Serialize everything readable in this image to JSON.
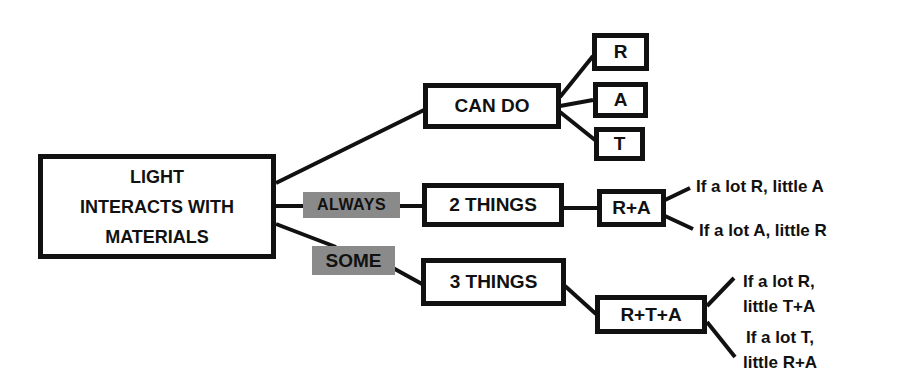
{
  "diagram": {
    "root": {
      "lines": [
        "LIGHT",
        "INTERACTS WITH",
        "MATERIALS"
      ]
    },
    "edge_labels": {
      "always": "ALWAYS",
      "some": "SOME"
    },
    "nodes": {
      "can_do": "CAN DO",
      "r": "R",
      "a": "A",
      "t": "T",
      "two_things": "2 THINGS",
      "r_plus_a": "R+A",
      "three_things": "3 THINGS",
      "r_plus_t_plus_a": "R+T+A"
    },
    "notes": {
      "lot_r_little_a": "If a lot R, little A",
      "lot_a_little_r": "If a lot A, little R",
      "lot_r_little_ta": [
        "If a lot R,",
        "little T+A"
      ],
      "lot_t_little_ra": [
        "If a lot T,",
        "little R+A"
      ]
    },
    "colors": {
      "line": "#111111",
      "label_bg": "#8a8a8a"
    }
  }
}
